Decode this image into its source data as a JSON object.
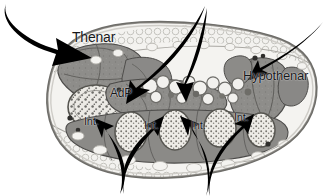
{
  "figure": {
    "name": "hand-cross-section-anatomy",
    "width": 325,
    "height": 196,
    "background_color": "#ffffff",
    "ink_color": "#000000"
  },
  "labels": {
    "thenar": "Thenar",
    "adp": "AdP",
    "hypothenar": "Hypothenar",
    "interossei": [
      "Int.",
      "Int.",
      "Int.",
      "Int."
    ]
  },
  "arrows": [
    {
      "name": "arrow-to-thenar",
      "from": [
        8,
        8
      ],
      "to": [
        84,
        52
      ],
      "direction": "down-right"
    },
    {
      "name": "arrow-to-adp-left",
      "from": [
        204,
        8
      ],
      "to": [
        133,
        98
      ],
      "direction": "down-left"
    },
    {
      "name": "arrow-to-lumbrical",
      "from": [
        206,
        10
      ],
      "to": [
        186,
        95
      ],
      "direction": "down"
    },
    {
      "name": "arrow-to-hypothenar",
      "from": [
        322,
        24
      ],
      "to": [
        262,
        74
      ],
      "direction": "down-left"
    },
    {
      "name": "arrow-to-int-1",
      "from": [
        118,
        192
      ],
      "to": [
        105,
        126
      ],
      "direction": "up-left"
    },
    {
      "name": "arrow-to-int-2",
      "from": [
        122,
        192
      ],
      "to": [
        150,
        123
      ],
      "direction": "up-right"
    },
    {
      "name": "arrow-to-int-3",
      "from": [
        203,
        194
      ],
      "to": [
        193,
        124
      ],
      "direction": "up-left"
    },
    {
      "name": "arrow-to-int-4",
      "from": [
        209,
        194
      ],
      "to": [
        240,
        122
      ],
      "direction": "up-right"
    }
  ],
  "anatomy": {
    "outline_name": "palm-cross-section-outline",
    "muscle_regions": [
      {
        "name": "thenar-muscle-mass",
        "shade": "#8d8d8d"
      },
      {
        "name": "adductor-pollicis",
        "shade": "#8a8a8a"
      },
      {
        "name": "hypothenar-muscle-mass",
        "shade": "#8b8b8b"
      },
      {
        "name": "interosseous-muscles",
        "shade": "#939393"
      }
    ],
    "bone_name": "metacarpal-bone",
    "bone_shade": "#e7e6e2",
    "fat_shade": "#f0efec",
    "tendon_name": "flexor-tendon"
  }
}
